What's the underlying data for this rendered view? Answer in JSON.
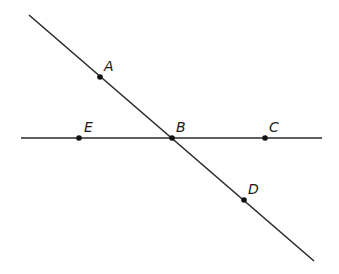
{
  "diagram": {
    "colors": {
      "line": "#2a2a2a",
      "point": "#111111",
      "background": "#ffffff"
    },
    "lines": [
      {
        "id": "line-AD",
        "x1": 29,
        "y1": 15,
        "x2": 314,
        "y2": 261
      },
      {
        "id": "line-EC",
        "x1": 21,
        "y1": 138,
        "x2": 322,
        "y2": 138
      }
    ],
    "points": [
      {
        "label": "A",
        "cx": 100,
        "cy": 77,
        "lx": 104,
        "ly": 71
      },
      {
        "label": "B",
        "cx": 172,
        "cy": 138,
        "lx": 176,
        "ly": 132
      },
      {
        "label": "C",
        "cx": 265,
        "cy": 138,
        "lx": 269,
        "ly": 132
      },
      {
        "label": "D",
        "cx": 244,
        "cy": 200,
        "lx": 248,
        "ly": 194
      },
      {
        "label": "E",
        "cx": 79,
        "cy": 138,
        "lx": 84,
        "ly": 132
      }
    ]
  }
}
